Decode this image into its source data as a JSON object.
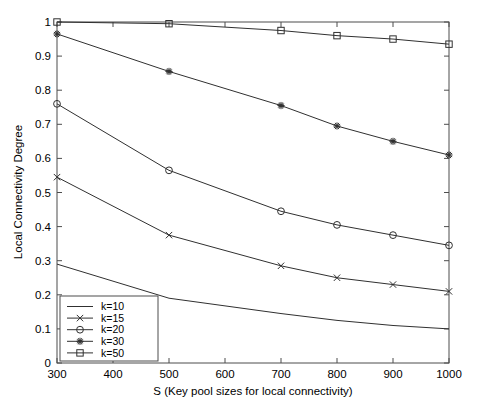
{
  "chart_data": {
    "type": "line",
    "title": "",
    "subtitle": "",
    "xlabel": "S (Key pool sizes for local connectivity)",
    "ylabel": "Local Connectivity Degree",
    "x": [
      300,
      500,
      700,
      800,
      900,
      1000
    ],
    "xlim": [
      300,
      1000
    ],
    "ylim": [
      0,
      1
    ],
    "xticks": [
      300,
      400,
      500,
      600,
      700,
      800,
      900,
      1000
    ],
    "xticklabels": [
      "300",
      "400",
      "500",
      "600",
      "700",
      "800",
      "900",
      "1000"
    ],
    "yticks": [
      0,
      0.1,
      0.2,
      0.3,
      0.4,
      0.5,
      0.6,
      0.7,
      0.8,
      0.9,
      1
    ],
    "yticklabels": [
      "0",
      "0.1",
      "0.2",
      "0.3",
      "0.4",
      "0.5",
      "0.6",
      "0.7",
      "0.8",
      "0.9",
      "1"
    ],
    "grid": false,
    "legend_position": "lower left",
    "line_color": "#303030",
    "series": [
      {
        "name": "k=10",
        "marker": "none",
        "values": [
          0.29,
          0.19,
          0.145,
          0.125,
          0.11,
          0.1
        ]
      },
      {
        "name": "k=15",
        "marker": "x",
        "values": [
          0.545,
          0.375,
          0.285,
          0.25,
          0.23,
          0.21
        ]
      },
      {
        "name": "k=20",
        "marker": "circle",
        "values": [
          0.76,
          0.565,
          0.445,
          0.405,
          0.375,
          0.345
        ]
      },
      {
        "name": "k=30",
        "marker": "star",
        "values": [
          0.965,
          0.855,
          0.755,
          0.695,
          0.65,
          0.61
        ]
      },
      {
        "name": "k=50",
        "marker": "square",
        "values": [
          1.0,
          0.995,
          0.975,
          0.96,
          0.95,
          0.935
        ]
      }
    ],
    "legend_entries": [
      "k=10",
      "k=15",
      "k=20",
      "k=30",
      "k=50"
    ]
  }
}
